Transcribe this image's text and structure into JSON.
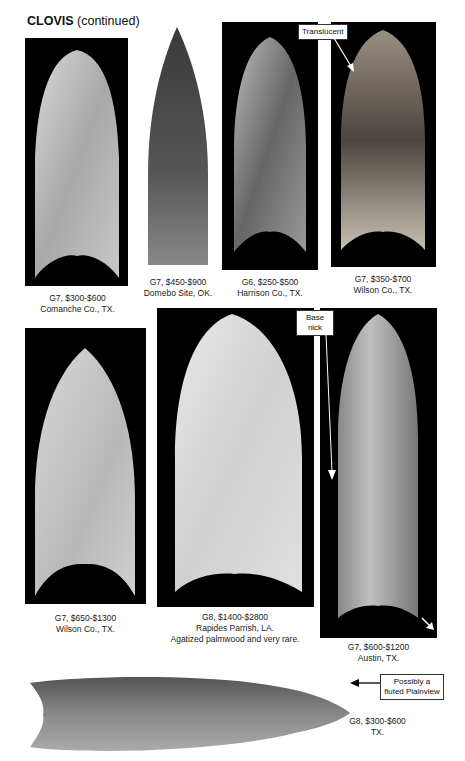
{
  "page": {
    "title_bold": "CLOVIS",
    "title_rest": " (continued)"
  },
  "artifacts": [
    {
      "grade_value": "G7, $300-$600",
      "location": "Comanche Co., TX."
    },
    {
      "grade_value": "G7, $450-$900",
      "location": "Domebo Site, OK."
    },
    {
      "grade_value": "G6, $250-$500",
      "location": "Harrison Co., TX."
    },
    {
      "grade_value": "G7, $350-$700",
      "location": "Wilson Co., TX.",
      "annotation": "Translucent"
    },
    {
      "grade_value": "G7, $650-$1300",
      "location": "Wilson Co., TX."
    },
    {
      "grade_value": "G8, $1400-$2800",
      "location": "Rapides Parrish, LA.",
      "note": "Agatized palmwood and very rare."
    },
    {
      "grade_value": "G7, $600-$1200",
      "location": "Austin, TX.",
      "annotation": "Base nick"
    },
    {
      "grade_value": "G8, $300-$600",
      "location": "TX.",
      "annotation": "Possibly a fluted Plainview"
    }
  ]
}
